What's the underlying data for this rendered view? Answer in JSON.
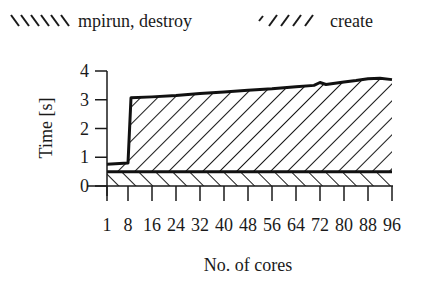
{
  "chart_data": {
    "type": "area",
    "stacked": true,
    "title": "",
    "xlabel": "No. of cores",
    "ylabel": "Time [s]",
    "xlim": [
      1,
      96
    ],
    "ylim": [
      0,
      4
    ],
    "grid": false,
    "legend_position": "top",
    "x_ticks": [
      1,
      8,
      16,
      24,
      32,
      40,
      48,
      56,
      64,
      72,
      80,
      88,
      96
    ],
    "x_tick_labels": [
      "1",
      "8",
      "16",
      "24",
      "32",
      "40",
      "48",
      "56",
      "64",
      "72",
      "80",
      "88",
      "96"
    ],
    "y_ticks": [
      0,
      1,
      2,
      3,
      4
    ],
    "y_tick_labels": [
      "0",
      "1",
      "2",
      "3",
      "4"
    ],
    "x": [
      1,
      8,
      9,
      16,
      24,
      32,
      40,
      48,
      56,
      64,
      70,
      72,
      74,
      80,
      84,
      88,
      92,
      96
    ],
    "series": [
      {
        "name": "create",
        "hatch": "/////",
        "values": [
          0.5,
          0.5,
          0.5,
          0.5,
          0.5,
          0.5,
          0.5,
          0.5,
          0.5,
          0.5,
          0.5,
          0.5,
          0.5,
          0.5,
          0.5,
          0.5,
          0.5,
          0.5
        ]
      },
      {
        "name": "mpirun, destroy",
        "hatch": "\\\\\\\\\\\\",
        "values": [
          0.26,
          0.3,
          2.57,
          2.6,
          2.65,
          2.72,
          2.77,
          2.83,
          2.88,
          2.95,
          3.0,
          3.1,
          3.03,
          3.12,
          3.17,
          3.23,
          3.25,
          3.2
        ]
      }
    ],
    "totals": [
      0.76,
      0.8,
      3.07,
      3.1,
      3.15,
      3.22,
      3.27,
      3.33,
      3.38,
      3.45,
      3.5,
      3.6,
      3.53,
      3.62,
      3.67,
      3.73,
      3.75,
      3.7
    ]
  },
  "legend": {
    "items": [
      {
        "label": "mpirun, destroy",
        "swatch": "\\\\\\\\\\\\"
      },
      {
        "label": "create",
        "swatch": "/////"
      }
    ]
  },
  "axes": {
    "xlabel": "No. of cores",
    "ylabel": "Time [s]"
  }
}
